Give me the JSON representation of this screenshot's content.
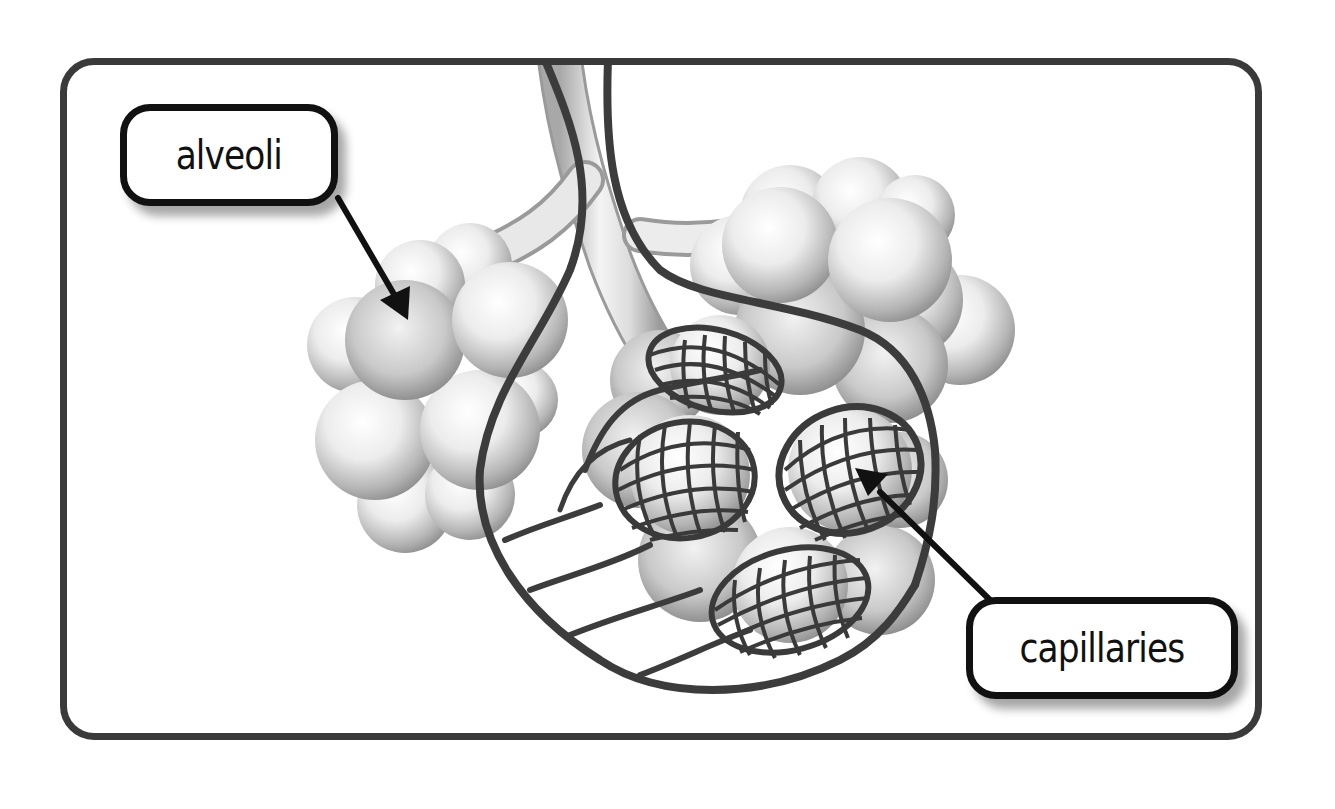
{
  "diagram": {
    "labels": {
      "alveoli": "alveoli",
      "capillaries": "capillaries"
    },
    "arrows": [
      {
        "from": "alveoli",
        "points_to": "alveolus in left cluster"
      },
      {
        "from": "capillaries",
        "points_to": "capillary network around alveolus"
      }
    ],
    "colors": {
      "frame": "#3a3a3a",
      "label_border": "#111111",
      "arrow": "#111111",
      "capillary": "#3c3c3c",
      "alveoli_light": "#f4f4f4",
      "alveoli_shadow": "#8a8a8a"
    }
  }
}
